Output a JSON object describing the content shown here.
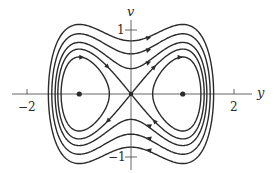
{
  "figure": {
    "type": "phase-portrait",
    "axes": {
      "horizontal": {
        "name": "y",
        "ticks": [
          {
            "value": -2,
            "label": "−2"
          },
          {
            "value": 2,
            "label": "2"
          }
        ]
      },
      "vertical": {
        "name": "v",
        "ticks": [
          {
            "value": 1,
            "label": "1"
          },
          {
            "value": -1,
            "label": "−1"
          }
        ]
      }
    },
    "equilibria": [
      {
        "y": -1,
        "v": 0,
        "kind": "center"
      },
      {
        "y": 0,
        "v": 0,
        "kind": "saddle"
      },
      {
        "y": 1,
        "v": 0,
        "kind": "center"
      }
    ],
    "system": "H(y, v) = v²/2 − y²/2 + y⁴/4",
    "level_curves": [
      {
        "H": -0.08,
        "kind": "inner-orbit"
      },
      {
        "H": 0,
        "kind": "separatrix"
      },
      {
        "H": 0.08,
        "kind": "outer-orbit"
      },
      {
        "H": 0.2,
        "kind": "outer-orbit"
      },
      {
        "H": 0.35,
        "kind": "outer-orbit"
      }
    ],
    "flow_direction": "clockwise",
    "colors": {
      "curve": "#2b2b2b",
      "axis": "#555555",
      "background": "#ffffff"
    }
  }
}
